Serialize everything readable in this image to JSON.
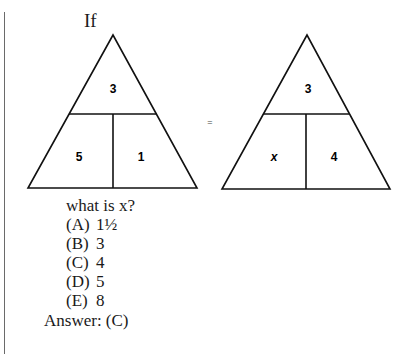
{
  "problem": {
    "intro": "If",
    "equals_sign": "=",
    "left_triangle": {
      "top": "3",
      "bottom_left": "5",
      "bottom_right": "1"
    },
    "right_triangle": {
      "top": "3",
      "bottom_left": "x",
      "bottom_right": "4"
    },
    "question": "what is x?",
    "options": [
      {
        "letter": "(A)",
        "value": "1½"
      },
      {
        "letter": "(B)",
        "value": "3"
      },
      {
        "letter": "(C)",
        "value": "4"
      },
      {
        "letter": "(D)",
        "value": "5"
      },
      {
        "letter": "(E)",
        "value": "8"
      }
    ],
    "answer": "Answer: (C)"
  }
}
